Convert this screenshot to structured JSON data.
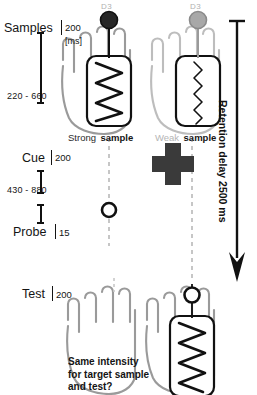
{
  "figure": {
    "title_hidden": "Tactile working memory task timeline",
    "timeline": {
      "events": [
        {
          "name": "samples",
          "label": "Samples",
          "duration": "200",
          "unit": "[ms]"
        },
        {
          "name": "cue",
          "label": "Cue",
          "duration": "200"
        },
        {
          "name": "probe",
          "label": "Probe",
          "duration": "15"
        },
        {
          "name": "test",
          "label": "Test",
          "duration": "200"
        }
      ],
      "intervals": [
        {
          "name": "samples-to-cue",
          "label": "220 - 660"
        },
        {
          "name": "cue-to-probe",
          "label": "430 - 880"
        }
      ]
    },
    "retention": {
      "label": "Retention delay 2500 ms"
    },
    "hands": {
      "top_left": {
        "finger_label": "D3",
        "sample_label_prefix": "Strong",
        "sample_label_suffix": "sample",
        "marker": "filled"
      },
      "top_right": {
        "finger_label": "D3",
        "sample_label_prefix": "Weak",
        "sample_label_suffix": "sample",
        "marker": "gray"
      },
      "bottom_right": {
        "marker": "open"
      }
    },
    "fixation": {
      "name": "fixation-cross"
    },
    "probe_marker": {
      "name": "probe-circle"
    },
    "question": {
      "line1": "Same intensity",
      "line2": "for target sample",
      "line3": "and test?"
    },
    "colors": {
      "ink": "#141414",
      "hand_outline": "#9a9a9a",
      "weak_gray": "#b5b5b5",
      "cross": "#3a3a3a",
      "dashed": "#b8b8b8"
    }
  }
}
